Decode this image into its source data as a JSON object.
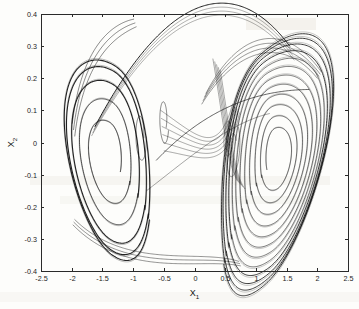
{
  "figure": {
    "title": "",
    "background_color": "#fdfdfb",
    "line_color": "#111111",
    "axis_color": "#2a2a2a"
  },
  "chart_data": {
    "type": "line",
    "title": "",
    "subtitle": "",
    "xlabel": "X",
    "xlabel_sub": "1",
    "ylabel": "X",
    "ylabel_sub": "2",
    "xlim": [
      -2.5,
      2.5
    ],
    "ylim": [
      -0.4,
      0.4
    ],
    "grid": false,
    "legend": "none",
    "xticks": [
      -2.5,
      -2,
      -1.5,
      -1,
      -0.5,
      0,
      0.5,
      1,
      1.5,
      2,
      2.5
    ],
    "xticklabels": [
      "-2.5",
      "-2",
      "-1.5",
      "-1",
      "-0.5",
      "0",
      "0.5",
      "1",
      "1.5",
      "2",
      "2.5"
    ],
    "yticks": [
      -0.4,
      -0.3,
      -0.2,
      -0.1,
      0,
      0.1,
      0.2,
      0.3,
      0.4
    ],
    "yticklabels": [
      "-0.4",
      "-0.3",
      "-0.2",
      "-0.1",
      "0",
      "0.1",
      "0.2",
      "0.3",
      "0.4"
    ],
    "series": [
      {
        "name": "trajectory",
        "kind": "phase-portrait-orbit",
        "color": "#111111",
        "linewidth": 0.6,
        "data_extent": {
          "x_min": -2.12,
          "x_max": 2.27,
          "y_min": -0.385,
          "y_max": 0.383
        },
        "left_lobe_center": [
          -1.42,
          -0.04
        ],
        "right_lobe_center": [
          1.35,
          -0.04
        ],
        "left_lobe_radii_x": [
          0.22,
          0.38,
          0.52,
          0.64,
          0.7
        ],
        "left_lobe_radii_y": [
          0.085,
          0.155,
          0.215,
          0.265,
          0.29
        ],
        "right_lobe_radii_x": [
          0.18,
          0.27,
          0.36,
          0.45,
          0.53,
          0.61,
          0.68,
          0.74,
          0.8,
          0.85,
          0.9,
          0.93
        ],
        "right_lobe_radii_y": [
          0.075,
          0.112,
          0.148,
          0.18,
          0.212,
          0.24,
          0.266,
          0.29,
          0.312,
          0.33,
          0.345,
          0.355
        ],
        "bridge_top_peak": [
          -0.9,
          0.383
        ],
        "bridge_cross_point": [
          0.4,
          0.16
        ],
        "inner_small_loop_left": [
          -0.88,
          0.02
        ],
        "inner_small_loop_mid": [
          -0.5,
          0.07
        ],
        "num_left_turns": 5,
        "num_right_turns": 12
      }
    ]
  },
  "axes": {
    "frame": {
      "left_px": 41,
      "top_px": 14,
      "right_px": 348,
      "bottom_px": 271
    },
    "tick_length_px": 3
  }
}
